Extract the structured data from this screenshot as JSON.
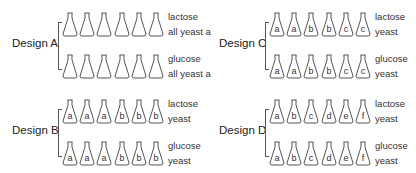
{
  "designs": [
    {
      "name": "Design A",
      "rows": [
        {
          "medium": "lactose",
          "yeast": "all yeast a",
          "flasks": [
            "",
            "",
            "",
            "",
            "",
            ""
          ]
        },
        {
          "medium": "glucose",
          "yeast": "all yeast a",
          "flasks": [
            "",
            "",
            "",
            "",
            "",
            ""
          ]
        }
      ]
    },
    {
      "name": "Design C",
      "rows": [
        {
          "medium": "lactose",
          "yeast": "yeast",
          "flasks": [
            "a",
            "a",
            "b",
            "b",
            "c",
            "c"
          ]
        },
        {
          "medium": "glucose",
          "yeast": "yeast",
          "flasks": [
            "a",
            "a",
            "b",
            "b",
            "c",
            "c"
          ]
        }
      ]
    },
    {
      "name": "Design B",
      "rows": [
        {
          "medium": "lactose",
          "yeast": "yeast",
          "flasks": [
            "a",
            "a",
            "a",
            "b",
            "b",
            "b"
          ]
        },
        {
          "medium": "glucose",
          "yeast": "yeast",
          "flasks": [
            "a",
            "a",
            "a",
            "b",
            "b",
            "b"
          ]
        }
      ]
    },
    {
      "name": "Design D",
      "rows": [
        {
          "medium": "lactose",
          "yeast": "yeast",
          "flasks": [
            "a",
            "b",
            "c",
            "d",
            "e",
            "f"
          ]
        },
        {
          "medium": "glucose",
          "yeast": "yeast",
          "flasks": [
            "a",
            "b",
            "c",
            "d",
            "e",
            "f"
          ]
        }
      ]
    }
  ],
  "colors": {
    "stroke": "#555555",
    "text": "#222222",
    "background": "#ffffff"
  }
}
